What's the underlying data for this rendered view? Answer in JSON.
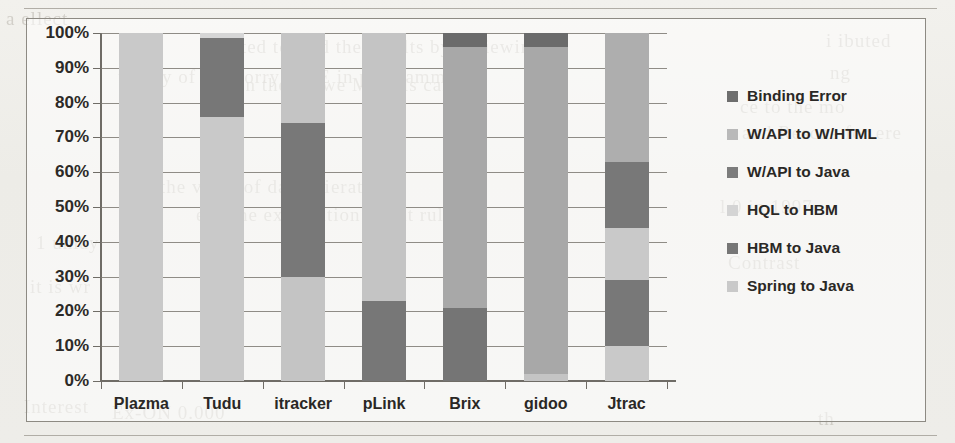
{
  "page": {
    "bleed_text": [
      {
        "text": "a ellect",
        "x": 6,
        "y": 8
      },
      {
        "text": "a cited to find the results by reviewing",
        "x": 210,
        "y": 36
      },
      {
        "text": "i ibuted",
        "x": 826,
        "y": 30
      },
      {
        "text": "unluly of the dorry MDE in programming",
        "x": 118,
        "y": 66
      },
      {
        "text": "ng",
        "x": 830,
        "y": 62
      },
      {
        "text": "an the hrowe MDE is called",
        "x": 236,
        "y": 74
      },
      {
        "text": "ce to the mo",
        "x": 740,
        "y": 96
      },
      {
        "text": "and Rescue for ere",
        "x": 742,
        "y": 122
      },
      {
        "text": "the value of data mieration",
        "x": 160,
        "y": 176
      },
      {
        "text": "l 0 in 1997",
        "x": 720,
        "y": 196
      },
      {
        "text": "ets, the ex mitation the at rule",
        "x": 196,
        "y": 204
      },
      {
        "text": "1 unlay",
        "x": 36,
        "y": 232
      },
      {
        "text": "Contrast",
        "x": 728,
        "y": 252
      },
      {
        "text": "it is wr",
        "x": 30,
        "y": 276
      },
      {
        "text": "Interest",
        "x": 24,
        "y": 396
      },
      {
        "text": "Ex-ON 0.000",
        "x": 112,
        "y": 402
      },
      {
        "text": "th",
        "x": 818,
        "y": 408
      }
    ]
  },
  "chart_data": {
    "type": "bar",
    "title": "",
    "xlabel": "",
    "ylabel": "",
    "ylim": [
      0,
      100
    ],
    "grid": true,
    "legend_position": "right",
    "stacked": true,
    "categories": [
      "Plazma",
      "Tudu",
      "itracker",
      "pLink",
      "Brix",
      "gidoo",
      "Jtrac"
    ],
    "tick_labels": [
      "0%",
      "10%",
      "20%",
      "30%",
      "40%",
      "50%",
      "60%",
      "70%",
      "80%",
      "90%",
      "100%"
    ],
    "tick_values": [
      0,
      10,
      20,
      30,
      40,
      50,
      60,
      70,
      80,
      90,
      100
    ],
    "series": [
      {
        "name": "Spring to Java",
        "color": "#c8c8c8",
        "values": [
          100,
          76,
          0,
          0,
          0,
          2,
          10
        ]
      },
      {
        "name": "HBM to Java",
        "color": "#7a7a7a",
        "values": [
          0,
          22.5,
          0,
          23,
          21,
          0,
          19
        ]
      },
      {
        "name": "HQL to HBM",
        "color": "#d9d9d9",
        "values": [
          0,
          1.5,
          0,
          0,
          0,
          0,
          15
        ]
      },
      {
        "name": "W/API to Java",
        "color": "#7a7a7a",
        "values": [
          0,
          0,
          44,
          0,
          0,
          0,
          19
        ]
      },
      {
        "name": "W/API to W/HTML",
        "color": "#c2c2c2",
        "values": [
          0,
          0,
          56,
          77,
          75,
          94,
          37
        ]
      },
      {
        "name": "Binding Error",
        "color": "#6e6e6e",
        "values": [
          0,
          0,
          0,
          0,
          4,
          4,
          0
        ]
      }
    ],
    "bars": [
      {
        "category": "Plazma",
        "segments": [
          {
            "series": "Spring to Java",
            "from": 0,
            "to": 100,
            "color": "#c9c9c9"
          }
        ]
      },
      {
        "category": "Tudu",
        "segments": [
          {
            "series": "Spring to Java",
            "from": 0,
            "to": 76,
            "color": "#c9c9c9"
          },
          {
            "series": "HBM to Java",
            "from": 76,
            "to": 98.5,
            "color": "#777777"
          },
          {
            "series": "HQL to HBM",
            "from": 98.5,
            "to": 100,
            "color": "#d6d6d6"
          }
        ]
      },
      {
        "category": "itracker",
        "segments": [
          {
            "series": "W/API to W/HTML",
            "from": 0,
            "to": 30,
            "color": "#c4c4c4"
          },
          {
            "series": "W/API to Java",
            "from": 30,
            "to": 74,
            "color": "#787878"
          },
          {
            "series": "W/API to W/HTML",
            "from": 74,
            "to": 100,
            "color": "#c4c4c4"
          }
        ]
      },
      {
        "category": "pLink",
        "segments": [
          {
            "series": "HBM to Java",
            "from": 0,
            "to": 23,
            "color": "#777777"
          },
          {
            "series": "W/API to W/HTML",
            "from": 23,
            "to": 100,
            "color": "#c4c4c4"
          }
        ]
      },
      {
        "category": "Brix",
        "segments": [
          {
            "series": "HBM to Java",
            "from": 0,
            "to": 21,
            "color": "#757575"
          },
          {
            "series": "W/API to W/HTML",
            "from": 21,
            "to": 96,
            "color": "#a8a8a8"
          },
          {
            "series": "Binding Error",
            "from": 96,
            "to": 100,
            "color": "#6b6b6b"
          }
        ]
      },
      {
        "category": "gidoo",
        "segments": [
          {
            "series": "Spring to Java",
            "from": 0,
            "to": 2,
            "color": "#c4c4c4"
          },
          {
            "series": "W/API to W/HTML",
            "from": 2,
            "to": 96,
            "color": "#a8a8a8"
          },
          {
            "series": "Binding Error",
            "from": 96,
            "to": 100,
            "color": "#6b6b6b"
          }
        ]
      },
      {
        "category": "Jtrac",
        "segments": [
          {
            "series": "Spring to Java",
            "from": 0,
            "to": 10,
            "color": "#c9c9c9"
          },
          {
            "series": "W/API to Java",
            "from": 10,
            "to": 29,
            "color": "#787878"
          },
          {
            "series": "HQL to HBM",
            "from": 29,
            "to": 44,
            "color": "#c9c9c9"
          },
          {
            "series": "HBM to Java",
            "from": 44,
            "to": 63,
            "color": "#787878"
          },
          {
            "series": "W/API to W/HTML",
            "from": 63,
            "to": 100,
            "color": "#aeaeae"
          }
        ]
      }
    ],
    "legend": [
      {
        "label": "Binding Error",
        "color": "#6e6e6e"
      },
      {
        "label": "W/API to W/HTML",
        "color": "#b9b9b9"
      },
      {
        "label": "W/API to Java",
        "color": "#7c7c7c"
      },
      {
        "label": "HQL to HBM",
        "color": "#d4d4d4"
      },
      {
        "label": "HBM to Java",
        "color": "#767676"
      },
      {
        "label": "Spring to Java",
        "color": "#c9c9c9"
      }
    ]
  }
}
